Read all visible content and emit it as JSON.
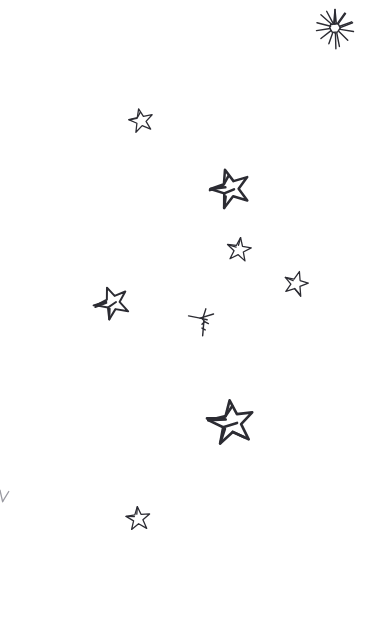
{
  "artwork": {
    "title": "Hand-drawn scattered stars sketch",
    "background_color": "#ffffff",
    "ink_color": "#2c2c33",
    "faint_ink_color": "#9a9aa2",
    "width": 369,
    "height": 627,
    "style": "pen sketch, doodle, monochrome",
    "element_count": 10
  },
  "elements": [
    {
      "id": "burst-star",
      "label": "Multi-ray sparkle burst star",
      "kind": "burst",
      "x": 313,
      "y": 6,
      "size": 44,
      "rotation": 0,
      "stroke_width": 1.4,
      "rays": 11
    },
    {
      "id": "star-small-upper-left",
      "label": "Small five-point star upper left",
      "kind": "five-point",
      "x": 128,
      "y": 107,
      "size": 26,
      "rotation": -12,
      "stroke_width": 1.3
    },
    {
      "id": "star-medium-upper-center",
      "label": "Medium five-point star upper center",
      "kind": "five-point",
      "x": 209,
      "y": 167,
      "size": 42,
      "rotation": -18,
      "stroke_width": 1.9
    },
    {
      "id": "star-small-center",
      "label": "Small five-point star center",
      "kind": "five-point",
      "x": 226,
      "y": 236,
      "size": 26,
      "rotation": 8,
      "stroke_width": 1.4
    },
    {
      "id": "star-small-right",
      "label": "Small five-point star right",
      "kind": "five-point",
      "x": 283,
      "y": 270,
      "size": 26,
      "rotation": 14,
      "stroke_width": 1.4
    },
    {
      "id": "star-medium-left",
      "label": "Medium five-point star left",
      "kind": "five-point",
      "x": 94,
      "y": 284,
      "size": 36,
      "rotation": -26,
      "stroke_width": 1.7
    },
    {
      "id": "partial-star-sketch",
      "label": "Partial abandoned star sketch with trailing stroke",
      "kind": "partial",
      "x": 186,
      "y": 305,
      "size": 32,
      "rotation": 0,
      "stroke_width": 1.3
    },
    {
      "id": "star-large-lower-center",
      "label": "Large five-point star lower center",
      "kind": "five-point",
      "x": 207,
      "y": 398,
      "size": 48,
      "rotation": -10,
      "stroke_width": 2.0
    },
    {
      "id": "star-small-lower-left",
      "label": "Small five-point star lower left",
      "kind": "five-point",
      "x": 125,
      "y": 505,
      "size": 26,
      "rotation": -6,
      "stroke_width": 1.4
    },
    {
      "id": "edge-mark",
      "label": "Faint partial mark cut off at left edge",
      "kind": "edge-fragment",
      "x": -4,
      "y": 488,
      "size": 22,
      "rotation": 0,
      "stroke_width": 1.1
    }
  ]
}
